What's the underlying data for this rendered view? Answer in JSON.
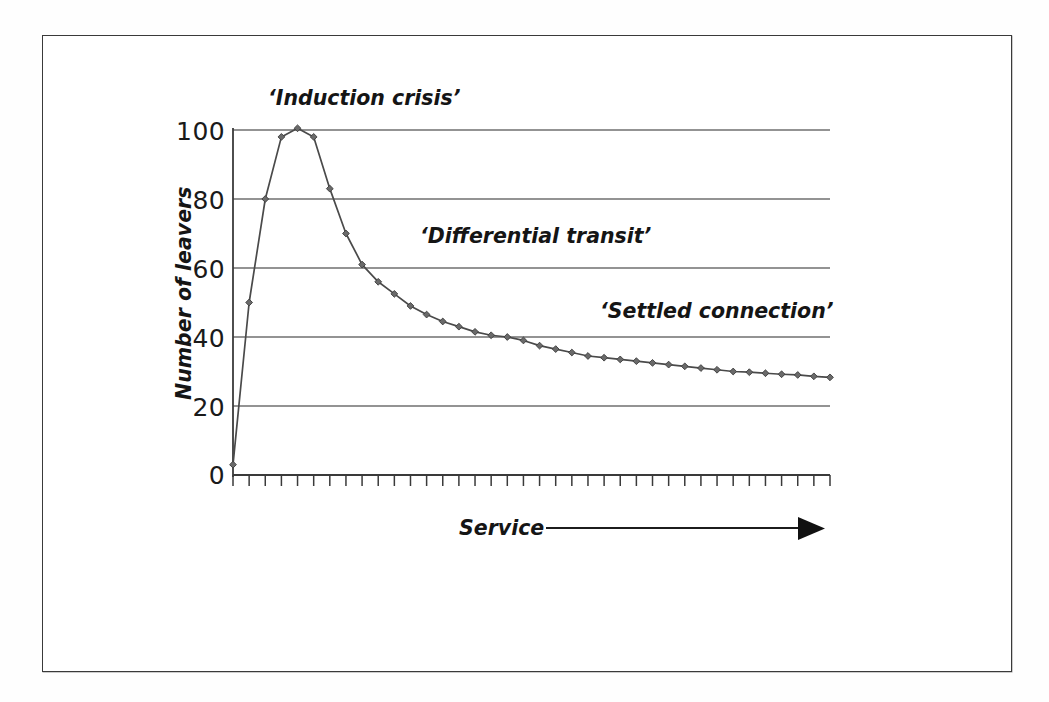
{
  "figure": {
    "border_color": "#3a3a3a",
    "background_color": "#ffffff"
  },
  "chart_data": {
    "type": "line",
    "title": "",
    "subtitle": "",
    "xlabel": "Service",
    "ylabel": "Number of leavers",
    "ylim": [
      0,
      100
    ],
    "y_ticks": [
      0,
      20,
      40,
      60,
      80,
      100
    ],
    "y_tick_labels": [
      "0",
      "20",
      "40",
      "60",
      "80",
      "100"
    ],
    "x_ticks_count": 38,
    "x_tick_labels": [],
    "grid": "horizontal",
    "legend": "none",
    "marker": "diamond",
    "line_color": "#4a4a4a",
    "marker_color": "#6a6a6a",
    "x": [
      0,
      1,
      2,
      3,
      4,
      5,
      6,
      7,
      8,
      9,
      10,
      11,
      12,
      13,
      14,
      15,
      16,
      17,
      18,
      19,
      20,
      21,
      22,
      23,
      24,
      25,
      26,
      27,
      28,
      29,
      30,
      31,
      32,
      33,
      34,
      35,
      36,
      37
    ],
    "values": [
      3,
      50,
      80,
      98,
      100.5,
      98,
      83,
      70,
      61,
      56,
      52.5,
      49,
      46.5,
      44.5,
      43,
      41.5,
      40.5,
      40,
      39,
      37.5,
      36.5,
      35.5,
      34.5,
      34,
      33.5,
      33,
      32.5,
      32,
      31.5,
      31,
      30.5,
      30,
      29.8,
      29.5,
      29.2,
      29,
      28.6,
      28.3
    ],
    "annotations": [
      {
        "id": "induction-crisis",
        "text": "‘Induction crisis’",
        "x_px": 268,
        "y_px": 105
      },
      {
        "id": "differential-transit",
        "text": "‘Differential transit’",
        "x_px": 420,
        "y_px": 243
      },
      {
        "id": "settled-connection",
        "text": "‘Settled connection’",
        "x_px": 600,
        "y_px": 318
      }
    ],
    "axis_arrow": {
      "label": "Service",
      "direction": "right"
    }
  }
}
